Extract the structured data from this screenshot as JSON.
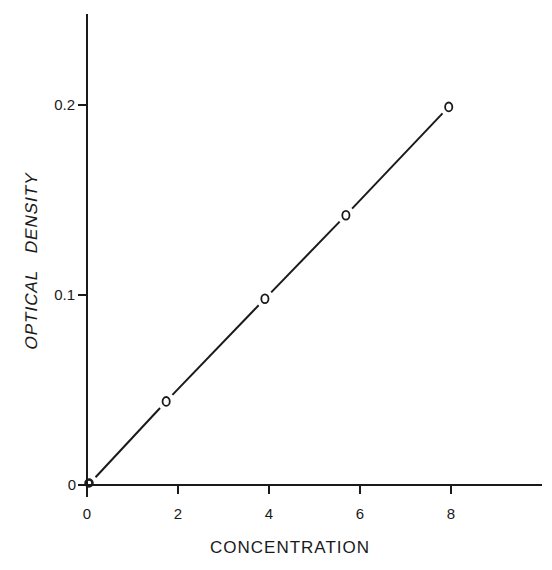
{
  "chart_data": {
    "type": "line",
    "title": "",
    "xlabel": "CONCENTRATION",
    "ylabel": "OPTICAL   DENSITY",
    "xlim": [
      0,
      10
    ],
    "ylim": [
      0,
      0.25
    ],
    "grid": false,
    "legend": null,
    "x_ticks": [
      0,
      2,
      4,
      6,
      8
    ],
    "x_tick_labels": [
      "0",
      "2",
      "4",
      "6",
      "8"
    ],
    "y_ticks": [
      0,
      0.1,
      0.2
    ],
    "y_tick_labels": [
      "0",
      "0.1",
      "0.2"
    ],
    "series": [
      {
        "name": "measured",
        "marker": "open-circle",
        "x": [
          0,
          1.74,
          3.91,
          5.69,
          7.95
        ],
        "y": [
          0,
          0.044,
          0.098,
          0.142,
          0.199
        ]
      }
    ],
    "fit_line": {
      "x": [
        0.1,
        7.95
      ],
      "y": [
        0.003,
        0.199
      ]
    }
  },
  "colors": {
    "ink": "#1a1a1a",
    "background": "#ffffff"
  }
}
